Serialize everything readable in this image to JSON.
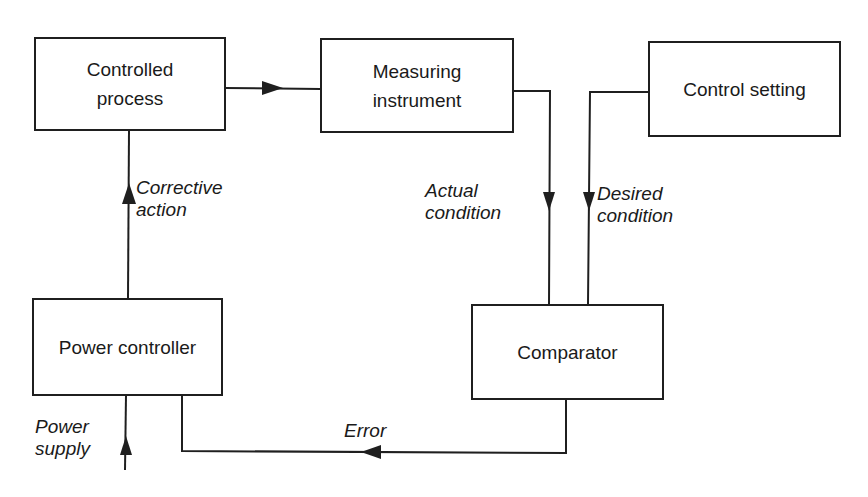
{
  "diagram": {
    "type": "block-diagram",
    "title": "",
    "nodes": [
      {
        "id": "controlled_process",
        "label_lines": [
          "Controlled",
          "process"
        ]
      },
      {
        "id": "measuring_instrument",
        "label_lines": [
          "Measuring",
          "instrument"
        ]
      },
      {
        "id": "control_setting",
        "label_lines": [
          "Control setting"
        ]
      },
      {
        "id": "power_controller",
        "label_lines": [
          "Power controller"
        ]
      },
      {
        "id": "comparator",
        "label_lines": [
          "Comparator"
        ]
      }
    ],
    "edges": [
      {
        "from": "controlled_process",
        "to": "measuring_instrument",
        "label": ""
      },
      {
        "from": "measuring_instrument",
        "to": "comparator",
        "label": "Actual condition"
      },
      {
        "from": "control_setting",
        "to": "comparator",
        "label": "Desired condition"
      },
      {
        "from": "comparator",
        "to": "power_controller",
        "label": "Error"
      },
      {
        "from": "power_controller",
        "to": "controlled_process",
        "label": "Corrective action"
      },
      {
        "from": "external",
        "to": "power_controller",
        "label": "Power supply"
      }
    ],
    "labels": {
      "corrective_action": [
        "Corrective",
        "action"
      ],
      "actual_condition": [
        "Actual",
        "condition"
      ],
      "desired_condition": [
        "Desired",
        "condition"
      ],
      "error": [
        "Error"
      ],
      "power_supply": [
        "Power",
        "supply"
      ]
    },
    "colors": {
      "line": "#1f1f1f",
      "background": "#ffffff",
      "text": "#1a1a1a"
    }
  }
}
